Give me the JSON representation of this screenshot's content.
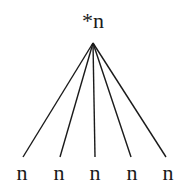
{
  "diagram": {
    "type": "tree",
    "root": {
      "label": "*n",
      "x": 93,
      "y": 28
    },
    "apex": {
      "x": 93,
      "y": 43
    },
    "children": [
      {
        "label": "n",
        "x": 22,
        "line_end_x": 23
      },
      {
        "label": "n",
        "x": 59,
        "line_end_x": 60
      },
      {
        "label": "n",
        "x": 95,
        "line_end_x": 95
      },
      {
        "label": "n",
        "x": 132,
        "line_end_x": 131
      },
      {
        "label": "n",
        "x": 168,
        "line_end_x": 166
      }
    ],
    "line_end_y": 157,
    "child_label_y": 180,
    "line_color": "#1a1a1a"
  }
}
